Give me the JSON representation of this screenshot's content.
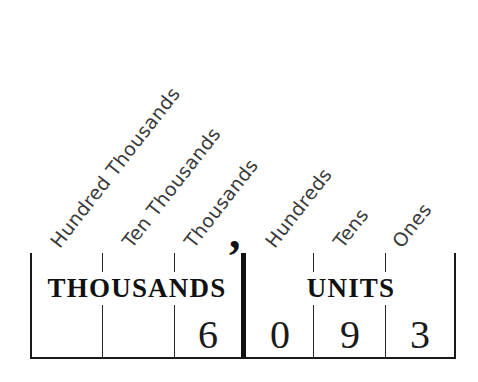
{
  "figure": {
    "kind": "place-value-chart",
    "number_shown": "6,093",
    "separator_symbol": ",",
    "ink_color": "#1a1a1a",
    "label_color": "#3a3a3a",
    "background_color": "#ffffff"
  },
  "groups": [
    {
      "id": "thousands",
      "label": "THOUSANDS"
    },
    {
      "id": "units",
      "label": "UNITS"
    }
  ],
  "columns": [
    {
      "id": "hundred-thousands",
      "label": "Hundred Thousands",
      "group": "thousands",
      "digit": ""
    },
    {
      "id": "ten-thousands",
      "label": "Ten Thousands",
      "group": "thousands",
      "digit": ""
    },
    {
      "id": "thousands",
      "label": "Thousands",
      "group": "thousands",
      "digit": "6"
    },
    {
      "id": "hundreds",
      "label": "Hundreds",
      "group": "units",
      "digit": "0"
    },
    {
      "id": "tens",
      "label": "Tens",
      "group": "units",
      "digit": "9"
    },
    {
      "id": "ones",
      "label": "Ones",
      "group": "units",
      "digit": "3"
    }
  ]
}
